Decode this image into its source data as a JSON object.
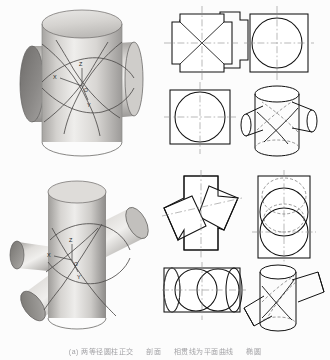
{
  "figure": {
    "background_color": "#fcfcfc",
    "line_color": "#1a1a1a",
    "centerline_color": "#8a8a8a",
    "hidden_line_color": "#6d6d6d",
    "shading": {
      "highlight": "#f0efed",
      "midtone": "#c9c7c4",
      "shadow": "#8d8b89",
      "dark_shadow": "#6a6866",
      "end_face": "#7e7c7a"
    }
  },
  "renders": {
    "perpendicular": {
      "name": "perpendicular-intersecting-cylinders-render",
      "description": "Two equal-diameter cylinders intersecting at right angles, shaded solid model with intersection curves",
      "axis_labels": [
        "Z",
        "X",
        "Y"
      ],
      "origin_label": "O"
    },
    "oblique": {
      "name": "oblique-intersecting-cylinders-render",
      "description": "Two equal-diameter cylinders intersecting obliquely, shaded solid model with intersection curves",
      "axis_labels": [
        "Z",
        "X",
        "Y"
      ],
      "origin_label": "O"
    }
  },
  "views": {
    "perpendicular": {
      "front": {
        "label": "front-view",
        "description": "Square outline with four projecting tabs and X-shaped intersection lines"
      },
      "side": {
        "label": "side-view",
        "description": "Circle inscribed in rectangle with centerlines"
      },
      "top": {
        "label": "top-view",
        "description": "Circle inscribed in rectangle with centerlines"
      },
      "axonometric": {
        "label": "axonometric-view",
        "description": "Wireframe axonometric of the perpendicular cross pipe with dashed hidden intersection curves"
      }
    },
    "oblique": {
      "front": {
        "label": "front-view",
        "description": "Vertical rectangle crossed by a tilted rectangle forming a pinwheel outline"
      },
      "side": {
        "label": "side-view",
        "description": "Rectangle with three overlapping circles, some shown as hidden dashed lines"
      },
      "top": {
        "label": "top-view",
        "description": "Horizontal rectangle containing overlapping circles and ellipse"
      },
      "axonometric": {
        "label": "axonometric-view",
        "description": "Wireframe axonometric of the oblique cross pipe with dashed hidden intersection curves"
      }
    }
  },
  "caption": {
    "segments": [
      "(a) 两等径圆柱正交",
      "剖面",
      "相贯线为平面曲线",
      "椭圆"
    ]
  }
}
